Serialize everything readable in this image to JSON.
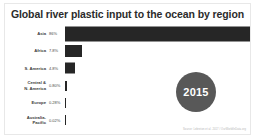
{
  "chart_data": {
    "type": "bar",
    "title": "Global river plastic input to the ocean by region",
    "orientation": "horizontal",
    "xlabel": "",
    "ylabel": "",
    "grid": false,
    "legend": null,
    "xlim": [
      0,
      86
    ],
    "categories": [
      "Asia",
      "Africa",
      "S. America",
      "Central &\nN. America",
      "Europe",
      "Australia-\nPacific"
    ],
    "values": [
      86,
      7.8,
      4.8,
      0.8,
      0.28,
      0.02
    ],
    "value_labels": [
      "86%",
      "7.8%",
      "4.8%",
      "0.80%",
      "0.28%",
      "0.02%"
    ],
    "units": "percent",
    "bar_color": "#262626",
    "annotations": [
      {
        "name": "year-badge",
        "text": "2015"
      }
    ]
  },
  "title": "Global river plastic input to the ocean by region",
  "badge": {
    "year": "2015"
  },
  "footer": {
    "source": "Source: Lebreton et al. 2017 / OurWorldInData.org"
  },
  "colors": {
    "bar": "#262626",
    "badge": "#585858",
    "title": "#2b2b2b",
    "frame": "#e8e8e8",
    "background": "#ffffff"
  }
}
